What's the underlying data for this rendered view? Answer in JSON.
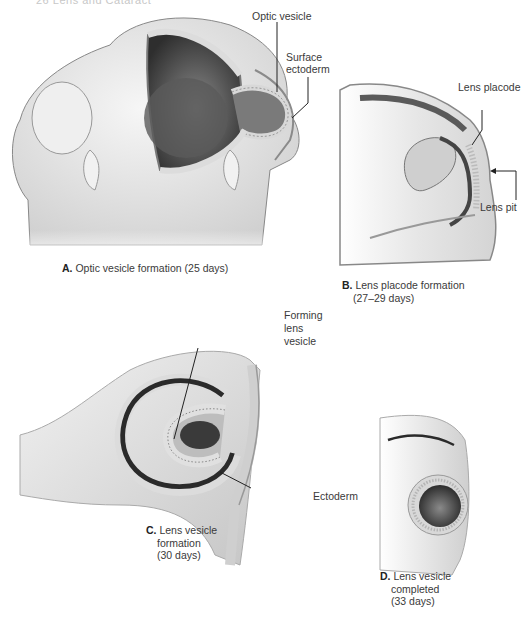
{
  "page_header": {
    "text": "26    Lens and Cataract"
  },
  "figure": {
    "panels": [
      {
        "id": "A",
        "letter": "A.",
        "caption": "Optic vesicle formation (25 days)",
        "labels": [
          "Optic vesicle",
          "Surface ectoderm"
        ]
      },
      {
        "id": "B",
        "letter": "B.",
        "caption_line1": "Lens placode formation",
        "caption_line2": "(27–29 days)",
        "labels": [
          "Lens placode",
          "Lens pit"
        ]
      },
      {
        "id": "C",
        "letter": "C.",
        "caption_line1": "Lens vesicle",
        "caption_line2": "formation",
        "caption_line3": "(30 days)",
        "labels": [
          "Forming lens vesicle",
          "Ectoderm"
        ]
      },
      {
        "id": "D",
        "letter": "D.",
        "caption_line1": "Lens vesicle",
        "caption_line2": "completed",
        "caption_line3": "(33 days)",
        "labels": []
      }
    ],
    "annotations": {
      "a_optic_vesicle": "Optic vesicle",
      "a_surface_line1": "Surface",
      "a_surface_line2": "ectoderm",
      "b_lens_placode": "Lens placode",
      "b_lens_pit": "Lens pit",
      "c_forming_line1": "Forming",
      "c_forming_line2": "lens",
      "c_forming_line3": "vesicle",
      "c_ectoderm": "Ectoderm"
    },
    "colors": {
      "tissue_light": "#e9e9e9",
      "tissue_mid": "#c9c9c9",
      "tissue_dark": "#5a5a5a",
      "cavity": "#3d3d3d",
      "leader_line": "#222222"
    }
  }
}
